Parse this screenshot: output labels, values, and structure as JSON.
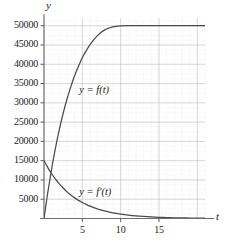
{
  "chart_data": {
    "type": "line",
    "title": "",
    "xlabel": "t",
    "ylabel": "y",
    "xlim": [
      0,
      21
    ],
    "ylim": [
      0,
      52000
    ],
    "grid": true,
    "legend_position": "inline-annotations",
    "xticks": [
      5,
      10,
      15
    ],
    "xtick_labels": [
      "5",
      "10",
      "15"
    ],
    "yticks": [
      5000,
      10000,
      15000,
      20000,
      25000,
      30000,
      35000,
      40000,
      45000,
      50000
    ],
    "ytick_labels": [
      "5000",
      "10000",
      "15000",
      "20000",
      "25000",
      "30000",
      "35000",
      "40000",
      "45000",
      "50000"
    ],
    "annotations": [
      {
        "text": "y = f(t)",
        "x": 4.6,
        "y": 33000
      },
      {
        "text": "y = f'(t)",
        "x": 4.6,
        "y": 6500
      }
    ],
    "series": [
      {
        "name": "y = f(t)",
        "label": "y = f(t)",
        "color": "#4a4a4a",
        "asymptote": 50000,
        "x": [
          0,
          0.5,
          1,
          1.5,
          2,
          2.5,
          3,
          3.5,
          4,
          4.5,
          5,
          5.5,
          6,
          6.5,
          7,
          7.5,
          8,
          8.5,
          9,
          9.5,
          10,
          11,
          12,
          13,
          14,
          15,
          16,
          17,
          18,
          19,
          20,
          21
        ],
        "values": [
          0,
          6800,
          12900,
          18300,
          23100,
          27300,
          31000,
          34200,
          37100,
          39500,
          41700,
          43500,
          45100,
          46400,
          47500,
          48400,
          49000,
          49400,
          49700,
          49850,
          49950,
          50000,
          50000,
          50000,
          50000,
          50000,
          50000,
          50000,
          50000,
          50000,
          50000,
          50000
        ]
      },
      {
        "name": "y = f'(t)",
        "label": "y = f'(t)",
        "color": "#4a4a4a",
        "x": [
          0,
          0.5,
          1,
          1.5,
          2,
          2.5,
          3,
          3.5,
          4,
          4.5,
          5,
          5.5,
          6,
          6.5,
          7,
          7.5,
          8,
          8.5,
          9,
          9.5,
          10,
          11,
          12,
          13,
          14,
          15,
          16,
          17,
          18,
          19,
          20,
          21
        ],
        "values": [
          15000,
          13200,
          11600,
          10200,
          9000,
          7900,
          6900,
          6100,
          5350,
          4700,
          4150,
          3650,
          3200,
          2800,
          2470,
          2170,
          1900,
          1680,
          1470,
          1300,
          1140,
          880,
          680,
          530,
          410,
          320,
          245,
          190,
          150,
          115,
          90,
          70
        ]
      }
    ]
  },
  "axis_labels": {
    "y": "y",
    "t": "t"
  }
}
